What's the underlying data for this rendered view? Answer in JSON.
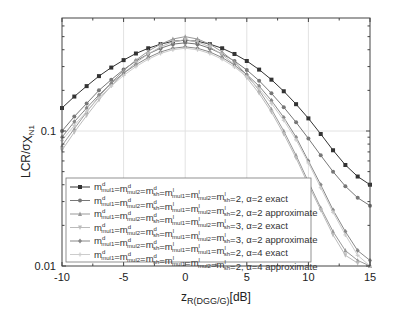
{
  "chart_data": {
    "type": "line",
    "title": "",
    "xlabel": "z_R(DGG/G) [dB]",
    "xlabel_main": "z",
    "xlabel_sub": "R(DGG/G)",
    "xlabel_unit": "[dB]",
    "ylabel": "LCR/σ_XN1",
    "ylabel_main": "LCR/σ",
    "ylabel_x": "X",
    "ylabel_sub": "N1",
    "xlim": [
      -10,
      15
    ],
    "ylim": [
      0.01,
      0.69
    ],
    "yscale": "log",
    "grid": true,
    "legend_position": "lower left",
    "x_ticks": [
      "-10",
      "-5",
      "0",
      "5",
      "10",
      "15"
    ],
    "y_ticks": [
      "0.01",
      "0.1"
    ],
    "x": [
      -10,
      -9,
      -8,
      -7,
      -6,
      -5,
      -4,
      -3,
      -2,
      -1,
      0,
      1,
      2,
      3,
      4,
      5,
      6,
      7,
      8,
      9,
      10,
      11,
      12,
      13,
      14,
      15
    ],
    "series": [
      {
        "name": "m^d_mul1=m^d_mul2=m^d_sh=m^l_mul1=m^l_mul2=m^l_sh=2, α=2 exact",
        "marker": "square",
        "color": "#333333",
        "values": [
          0.148,
          0.18,
          0.215,
          0.255,
          0.295,
          0.335,
          0.375,
          0.41,
          0.44,
          0.462,
          0.47,
          0.462,
          0.44,
          0.41,
          0.372,
          0.33,
          0.285,
          0.24,
          0.197,
          0.158,
          0.124,
          0.095,
          0.072,
          0.056,
          0.046,
          0.04
        ]
      },
      {
        "name": "m^d_mul1=m^d_mul2=m^d_sh=m^l_mul1=m^l_mul2=m^l_sh=2, α=2 approximate",
        "marker": "circle",
        "color": "#777777",
        "values": [
          0.1,
          0.128,
          0.16,
          0.2,
          0.24,
          0.285,
          0.33,
          0.372,
          0.41,
          0.44,
          0.45,
          0.44,
          0.41,
          0.372,
          0.33,
          0.283,
          0.236,
          0.19,
          0.15,
          0.116,
          0.088,
          0.066,
          0.05,
          0.039,
          0.032,
          0.028
        ]
      },
      {
        "name": "m^d_mul1=m^d_mul2=m^d_sh=m^l_mul1=m^l_mul2=m^l_sh=3, α=2 exact",
        "marker": "triangle-up",
        "color": "#999999",
        "values": [
          0.078,
          0.104,
          0.138,
          0.18,
          0.228,
          0.28,
          0.335,
          0.39,
          0.44,
          0.48,
          0.5,
          0.48,
          0.44,
          0.385,
          0.325,
          0.26,
          0.2,
          0.145,
          0.1,
          0.066,
          0.042,
          0.027,
          0.018,
          0.013,
          0.011,
          0.01
        ]
      },
      {
        "name": "m^d_mul1=m^d_mul2=m^d_sh=m^l_mul1=m^l_mul2=m^l_sh=3, α=2 approximate",
        "marker": "triangle-down",
        "color": "#bbbbbb",
        "values": [
          0.072,
          0.098,
          0.13,
          0.17,
          0.216,
          0.268,
          0.32,
          0.372,
          0.42,
          0.458,
          0.475,
          0.458,
          0.42,
          0.368,
          0.31,
          0.248,
          0.19,
          0.138,
          0.095,
          0.063,
          0.04,
          0.026,
          0.017,
          0.012,
          0.0105,
          0.0095
        ]
      },
      {
        "name": "m^d_mul1=m^d_mul2=m^d_sh=m^l_mul1=m^l_mul1=m^l_sh=2, α=4 exact",
        "marker": "diamond",
        "color": "#888888",
        "values": [
          0.09,
          0.117,
          0.148,
          0.185,
          0.225,
          0.268,
          0.31,
          0.35,
          0.385,
          0.41,
          0.42,
          0.41,
          0.385,
          0.35,
          0.308,
          0.262,
          0.215,
          0.168,
          0.126,
          0.09,
          0.06,
          0.04,
          0.026,
          0.018,
          0.013,
          0.011
        ]
      },
      {
        "name": "m^d_mul1=m^d_mul2=m^d_sh=m^l_mul1=m^l_mul2=m^l_sh=2, α=4 approximate",
        "marker": "plus",
        "color": "#cccccc",
        "values": [
          0.085,
          0.11,
          0.14,
          0.176,
          0.215,
          0.258,
          0.3,
          0.34,
          0.375,
          0.4,
          0.41,
          0.4,
          0.375,
          0.34,
          0.298,
          0.252,
          0.205,
          0.16,
          0.12,
          0.086,
          0.058,
          0.038,
          0.025,
          0.017,
          0.012,
          0.01
        ]
      }
    ],
    "legend": [
      {
        "m": "m",
        "parts": [
          "mul1",
          "mul2",
          "sh",
          "mul1",
          "mul2",
          "sh"
        ],
        "rest": "=2, α=2 exact"
      },
      {
        "m": "m",
        "parts": [
          "mul1",
          "mul2",
          "sh",
          "mul1",
          "mul2",
          "sh"
        ],
        "rest": "=2, α=2 approximate"
      },
      {
        "m": "m",
        "parts": [
          "mul1",
          "mul2",
          "sh",
          "mul1",
          "mul2",
          "sh"
        ],
        "rest": "=3, α=2 exact"
      },
      {
        "m": "m",
        "parts": [
          "mul1",
          "mul2",
          "sh",
          "mul1",
          "mul2",
          "sh"
        ],
        "rest": "=3, α=2 approximate"
      },
      {
        "m": "m",
        "parts": [
          "mul1",
          "mul2",
          "sh",
          "mul1",
          "mul1",
          "sh"
        ],
        "rest": "=2, α=4 exact"
      },
      {
        "m": "m",
        "parts": [
          "mul1",
          "mul2",
          "sh",
          "mul1",
          "mul2",
          "sh"
        ],
        "rest": "=2, α=4 approximate"
      }
    ]
  }
}
